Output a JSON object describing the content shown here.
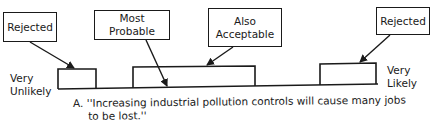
{
  "labels": {
    "rejected_left": "Rejected",
    "most_probable": "Most Probable",
    "also_acceptable_line1": "Also",
    "also_acceptable_line2": "Acceptable",
    "rejected_right": "Rejected"
  },
  "scale": {
    "left_line1": "Very",
    "left_line2": "Unlikely",
    "right_line1": "Very",
    "right_line2": "Likely"
  },
  "caption": {
    "line1": "A. ''Increasing industrial pollution controls will cause many jobs",
    "line2": "to be lost.''"
  }
}
